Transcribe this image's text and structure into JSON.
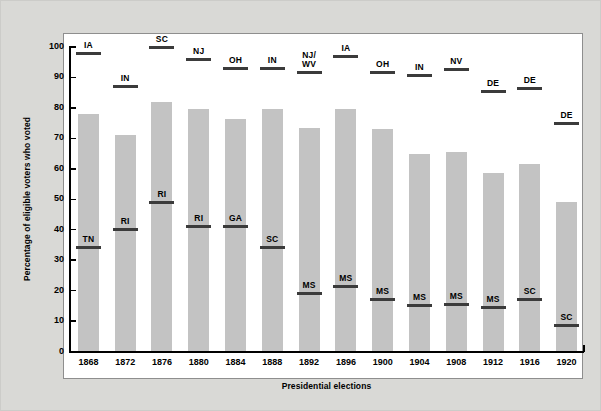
{
  "chart_data": {
    "type": "bar",
    "title": "",
    "xlabel": "Presidential elections",
    "ylabel": "Percentage of eligible voters who voted",
    "ylim": [
      0,
      100
    ],
    "ytick_labels": [
      "100",
      "90",
      "80",
      "70",
      "60",
      "50",
      "40",
      "30",
      "20",
      "10",
      "0"
    ],
    "ytick_values": [
      100,
      90,
      80,
      70,
      60,
      50,
      40,
      30,
      20,
      10,
      0
    ],
    "grid": false,
    "legend": "none",
    "categories": [
      "1868",
      "1872",
      "1876",
      "1880",
      "1884",
      "1888",
      "1892",
      "1896",
      "1900",
      "1904",
      "1908",
      "1912",
      "1916",
      "1920"
    ],
    "values": [
      78,
      71,
      82,
      79.5,
      76.5,
      79.5,
      73.5,
      79.5,
      73,
      65,
      65.5,
      58.5,
      61.5,
      49
    ],
    "series": [
      {
        "name": "National turnout",
        "values": [
          78,
          71,
          82,
          79.5,
          76.5,
          79.5,
          73.5,
          79.5,
          73,
          65,
          65.5,
          58.5,
          61.5,
          49
        ]
      },
      {
        "name": "Highest state turnout",
        "annotation_type": "marker-line",
        "labels": [
          "IA",
          "IN",
          "SC",
          "NJ",
          "OH",
          "IN",
          "NJ/\nWV",
          "IA",
          "OH",
          "IN",
          "NV",
          "DE",
          "DE",
          "DE"
        ],
        "values": [
          98,
          87,
          100,
          96,
          93,
          93,
          91.5,
          97,
          91.5,
          90.5,
          92.5,
          85.5,
          86.5,
          75
        ]
      },
      {
        "name": "Lowest state turnout",
        "annotation_type": "marker-line",
        "labels": [
          "TN",
          "RI",
          "RI",
          "RI",
          "GA",
          "SC",
          "MS",
          "MS",
          "MS",
          "MS",
          "MS",
          "MS",
          "SC",
          "SC"
        ],
        "values": [
          34,
          40,
          49,
          41,
          41,
          34,
          19,
          21.5,
          17,
          15,
          15.5,
          14.5,
          17,
          8.5
        ]
      }
    ],
    "colors": {
      "bar": "#c3c3c3",
      "marker": "#3b3b3b",
      "plot_background": "#ffffff",
      "page_background": "#d9d9d6",
      "axis": "#000000"
    }
  }
}
